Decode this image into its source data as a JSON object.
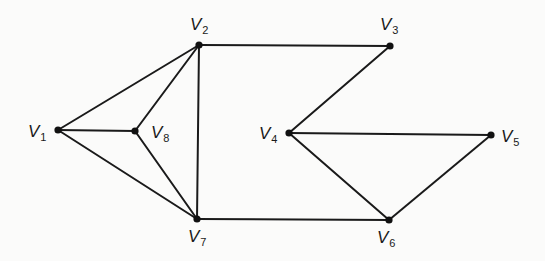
{
  "diagram": {
    "type": "undirected-graph",
    "colors": {
      "background": "#fbfbfa",
      "stroke": "#1a1a1a",
      "node": "#111111"
    },
    "nodes": [
      {
        "id": "V1",
        "letter": "V",
        "sub": "1",
        "x": 58,
        "y": 130,
        "lx": 28,
        "ly": 137
      },
      {
        "id": "V2",
        "letter": "V",
        "sub": "2",
        "x": 199,
        "y": 45,
        "lx": 190,
        "ly": 30
      },
      {
        "id": "V3",
        "letter": "V",
        "sub": "3",
        "x": 390,
        "y": 46,
        "lx": 380,
        "ly": 30
      },
      {
        "id": "V4",
        "letter": "V",
        "sub": "4",
        "x": 289,
        "y": 133,
        "lx": 259,
        "ly": 139
      },
      {
        "id": "V5",
        "letter": "V",
        "sub": "5",
        "x": 491,
        "y": 135,
        "lx": 501,
        "ly": 142
      },
      {
        "id": "V6",
        "letter": "V",
        "sub": "6",
        "x": 389,
        "y": 220,
        "lx": 377,
        "ly": 243
      },
      {
        "id": "V7",
        "letter": "V",
        "sub": "7",
        "x": 197,
        "y": 219,
        "lx": 188,
        "ly": 242
      },
      {
        "id": "V8",
        "letter": "V",
        "sub": "8",
        "x": 135,
        "y": 131,
        "lx": 151,
        "ly": 138
      }
    ],
    "edges": [
      [
        "V1",
        "V2"
      ],
      [
        "V1",
        "V8"
      ],
      [
        "V1",
        "V7"
      ],
      [
        "V8",
        "V2"
      ],
      [
        "V8",
        "V7"
      ],
      [
        "V2",
        "V7"
      ],
      [
        "V2",
        "V3"
      ],
      [
        "V3",
        "V4"
      ],
      [
        "V4",
        "V5"
      ],
      [
        "V4",
        "V6"
      ],
      [
        "V5",
        "V6"
      ],
      [
        "V7",
        "V6"
      ]
    ]
  }
}
